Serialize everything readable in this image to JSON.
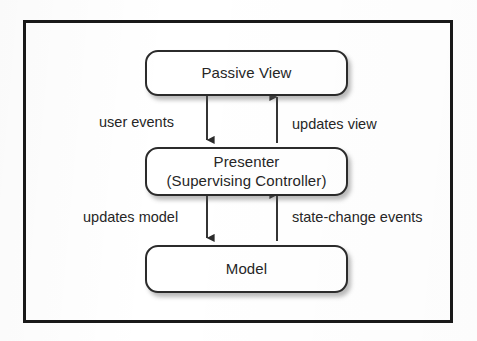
{
  "diagram": {
    "background_color": "#ffffff",
    "frame_color": "#191919",
    "node_border_color": "#2b2b2b",
    "text_color": "#262626",
    "arrow_color": "#2b2b2b",
    "nodes": [
      {
        "id": "passive-view",
        "label": "Passive View",
        "sublabel": ""
      },
      {
        "id": "presenter",
        "label": "Presenter",
        "sublabel": "(Supervising Controller)"
      },
      {
        "id": "model",
        "label": "Model",
        "sublabel": ""
      }
    ],
    "edges": [
      {
        "id": "user-events",
        "label": "user events",
        "from": "passive-view",
        "to": "presenter",
        "direction": "down"
      },
      {
        "id": "updates-view",
        "label": "updates view",
        "from": "presenter",
        "to": "passive-view",
        "direction": "up"
      },
      {
        "id": "updates-model",
        "label": "updates model",
        "from": "presenter",
        "to": "model",
        "direction": "down"
      },
      {
        "id": "state-change-events",
        "label": "state-change events",
        "from": "model",
        "to": "presenter",
        "direction": "up"
      }
    ]
  }
}
